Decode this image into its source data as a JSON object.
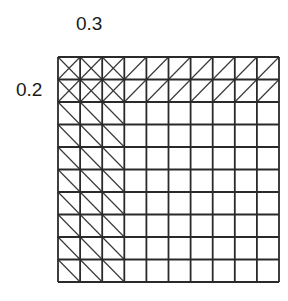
{
  "labels": {
    "top": "0.3",
    "left": "0.2"
  },
  "grid": {
    "rows": 10,
    "cols": 10,
    "origin_x": 58,
    "origin_y": 57,
    "cell_w": 22.1,
    "cell_h": 22.5,
    "line_color": "#2a2a2a",
    "diag_color": "#3a3a3a",
    "regions": [
      {
        "name": "overlap-region",
        "row_start": 0,
        "row_end": 2,
        "col_start": 0,
        "col_end": 3,
        "pattern": "cross"
      },
      {
        "name": "top-strip",
        "row_start": 0,
        "row_end": 2,
        "col_start": 3,
        "col_end": 10,
        "pattern": "forward-slash"
      },
      {
        "name": "left-strip",
        "row_start": 2,
        "row_end": 10,
        "col_start": 0,
        "col_end": 3,
        "pattern": "back-slash"
      }
    ]
  }
}
